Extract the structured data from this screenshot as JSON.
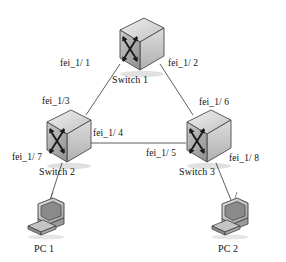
{
  "diagram": {
    "background_color": "#ffffff",
    "line_color": "#555555",
    "text_color": "#111111"
  },
  "nodes": [
    {
      "id": "switch1",
      "label": "Switch  1",
      "type": "switch-icon",
      "x": 140,
      "y": 45
    },
    {
      "id": "switch2",
      "label": "Switch  2",
      "type": "switch-icon",
      "x": 67,
      "y": 137
    },
    {
      "id": "switch3",
      "label": "Switch  3",
      "type": "switch-icon",
      "x": 207,
      "y": 137
    },
    {
      "id": "pc1",
      "label": "PC 1",
      "type": "pc-icon",
      "x": 47,
      "y": 217
    },
    {
      "id": "pc2",
      "label": "PC 2",
      "type": "pc-icon",
      "x": 231,
      "y": 217
    }
  ],
  "ports": [
    {
      "id": "port-1-1",
      "label": "fei_1/ 1",
      "node": "switch1",
      "x": 86,
      "y": 64
    },
    {
      "id": "port-1-2",
      "label": "fei_1/ 2",
      "node": "switch1",
      "x": 193,
      "y": 64
    },
    {
      "id": "port-1-3",
      "label": "fei_1/3",
      "node": "switch2",
      "x": 67,
      "y": 103
    },
    {
      "id": "port-1-4",
      "label": "fei_1/ 4",
      "node": "switch2",
      "x": 119,
      "y": 135
    },
    {
      "id": "port-1-5",
      "label": "fei_1/ 5",
      "node": "switch3",
      "x": 170,
      "y": 155
    },
    {
      "id": "port-1-6",
      "label": "fei_1/ 6",
      "node": "switch3",
      "x": 224,
      "y": 104
    },
    {
      "id": "port-1-7",
      "label": "fei_1/ 7",
      "node": "switch2",
      "x": 36,
      "y": 158
    },
    {
      "id": "port-1-8",
      "label": "fei_1/ 8",
      "node": "switch3",
      "x": 253,
      "y": 160
    }
  ],
  "links": [
    {
      "id": "link-s1-s2",
      "from": "switch1",
      "to": "switch2",
      "from_port": "fei_1/ 1",
      "to_port": "fei_1/3"
    },
    {
      "id": "link-s1-s3",
      "from": "switch1",
      "to": "switch3",
      "from_port": "fei_1/ 2",
      "to_port": "fei_1/ 6"
    },
    {
      "id": "link-s2-s3",
      "from": "switch2",
      "to": "switch3",
      "from_port": "fei_1/ 4",
      "to_port": "fei_1/ 5"
    },
    {
      "id": "link-s2-pc1",
      "from": "switch2",
      "to": "pc1",
      "from_port": "fei_1/ 7",
      "to_port": ""
    },
    {
      "id": "link-s3-pc2",
      "from": "switch3",
      "to": "pc2",
      "from_port": "fei_1/ 8",
      "to_port": ""
    }
  ],
  "labels": {
    "switch1": "Switch  1",
    "switch2": "Switch  2",
    "switch3": "Switch  3",
    "pc1": "PC 1",
    "pc2": "PC 2",
    "port11": "fei_1/ 1",
    "port12": "fei_1/ 2",
    "port13": "fei_1/3",
    "port14": "fei_1/ 4",
    "port15": "fei_1/ 5",
    "port16": "fei_1/ 6",
    "port17": "fei_1/ 7",
    "port18": "fei_1/ 8"
  }
}
